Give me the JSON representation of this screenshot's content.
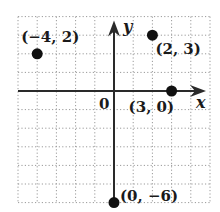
{
  "chart_data": {
    "type": "scatter",
    "title": "",
    "xlabel": "x",
    "ylabel": "y",
    "origin_label": "0",
    "xlim": [
      -5,
      5
    ],
    "ylim": [
      -6,
      4
    ],
    "grid": true,
    "grid_style": "dotted",
    "points": [
      {
        "x": -4,
        "y": 2,
        "label": "(−4, 2)"
      },
      {
        "x": 2,
        "y": 3,
        "label": "(2, 3)"
      },
      {
        "x": 3,
        "y": 0,
        "label": "(3, 0)"
      },
      {
        "x": 0,
        "y": -6,
        "label": "(0, −6)"
      }
    ]
  },
  "colors": {
    "axis": "#2a2a2a",
    "grid": "#9a9a9a",
    "point": "#111111"
  }
}
